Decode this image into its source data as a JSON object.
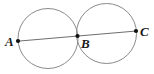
{
  "figure": {
    "background_color": "#ffffff",
    "width": 154,
    "height": 74
  },
  "style": {
    "circle_stroke": "#8a8a8a",
    "circle_stroke_width": 1,
    "circle_fill": "none",
    "line_stroke": "#6e6e6e",
    "line_stroke_width": 1,
    "point_fill": "#111111",
    "point_radius": 2.1,
    "label_color": "#1a1a1a"
  },
  "chart_data": {
    "type": "scatter",
    "xlabel": "",
    "ylabel": "",
    "xlim": [
      0,
      154
    ],
    "ylim": [
      74,
      0
    ],
    "grid": false,
    "legend": null,
    "circles": [
      {
        "name": "left-circle",
        "cx": 48.0,
        "cy": 38.5,
        "r": 30.0
      },
      {
        "name": "right-circle",
        "cx": 106.5,
        "cy": 33.5,
        "r": 30.0
      }
    ],
    "segments": [
      {
        "name": "line-ABC",
        "x1": 17.5,
        "y1": 41.2,
        "x2": 136.5,
        "y2": 31.0
      }
    ],
    "points": [
      {
        "label": "A",
        "x": 18.0,
        "y": 41.0
      },
      {
        "label": "B",
        "x": 77.5,
        "y": 36.0
      },
      {
        "label": "C",
        "x": 136.0,
        "y": 31.0
      }
    ]
  },
  "labels": {
    "a": "A",
    "b": "B",
    "c": "C"
  }
}
